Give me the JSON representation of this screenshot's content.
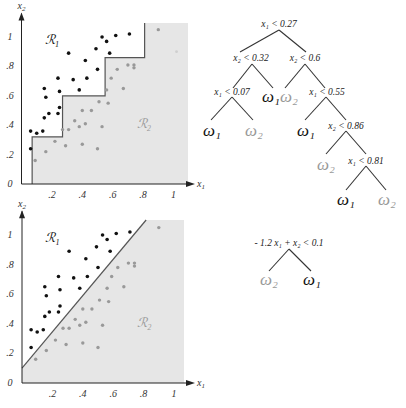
{
  "colors": {
    "class1": "#111111",
    "class2": "#999999",
    "shade": "#e6e6e6",
    "boundary": "#555555",
    "axis": "#222222"
  },
  "chart_data": [
    {
      "type": "scatter",
      "title": "",
      "xlabel": "x1",
      "ylabel": "x2",
      "xlim": [
        0,
        1.1
      ],
      "ylim": [
        0,
        1.1
      ],
      "x_ticks": [
        ".2",
        ".4",
        ".6",
        ".8",
        "1"
      ],
      "y_ticks": [
        "0",
        ".2",
        ".4",
        ".6",
        ".8",
        "1"
      ],
      "regions": [
        {
          "name": "R1",
          "label": "ℛ₁"
        },
        {
          "name": "R2",
          "label": "ℛ₂"
        }
      ],
      "boundary": {
        "kind": "axis-parallel",
        "steps": [
          [
            0.07,
            0
          ],
          [
            0.07,
            0.32
          ],
          [
            0.27,
            0.32
          ],
          [
            0.27,
            0.6
          ],
          [
            0.55,
            0.6
          ],
          [
            0.55,
            0.86
          ],
          [
            0.81,
            0.86
          ],
          [
            0.81,
            1.1
          ]
        ]
      },
      "series": [
        {
          "name": "omega1",
          "points": [
            [
              0.06,
              0.36
            ],
            [
              0.1,
              0.345
            ],
            [
              0.14,
              0.36
            ],
            [
              0.06,
              0.24
            ],
            [
              0.15,
              0.45
            ],
            [
              0.18,
              0.48
            ],
            [
              0.16,
              0.59
            ],
            [
              0.15,
              0.65
            ],
            [
              0.24,
              0.48
            ],
            [
              0.25,
              0.52
            ],
            [
              0.25,
              0.63
            ],
            [
              0.24,
              0.72
            ],
            [
              0.31,
              0.89
            ],
            [
              0.34,
              0.71
            ],
            [
              0.38,
              0.64
            ],
            [
              0.42,
              0.84
            ],
            [
              0.43,
              0.72
            ],
            [
              0.49,
              0.92
            ],
            [
              0.5,
              0.78
            ],
            [
              0.53,
              1.0
            ],
            [
              0.56,
              0.97
            ],
            [
              0.58,
              0.89
            ],
            [
              0.62,
              1.01
            ],
            [
              0.71,
              1.02
            ]
          ]
        },
        {
          "name": "omega2",
          "points": [
            [
              0.09,
              0.16
            ],
            [
              0.16,
              0.22
            ],
            [
              0.22,
              0.29
            ],
            [
              0.27,
              0.37
            ],
            [
              0.29,
              0.26
            ],
            [
              0.31,
              0.37
            ],
            [
              0.35,
              0.43
            ],
            [
              0.38,
              0.39
            ],
            [
              0.4,
              0.27
            ],
            [
              0.4,
              0.5
            ],
            [
              0.42,
              0.41
            ],
            [
              0.46,
              0.5
            ],
            [
              0.5,
              0.24
            ],
            [
              0.51,
              0.56
            ],
            [
              0.53,
              0.39
            ],
            [
              0.56,
              0.64
            ],
            [
              0.57,
              0.55
            ],
            [
              0.59,
              0.72
            ],
            [
              0.63,
              0.78
            ],
            [
              0.67,
              0.65
            ],
            [
              0.7,
              0.81
            ],
            [
              0.74,
              0.81
            ],
            [
              0.74,
              0.79
            ],
            [
              0.9,
              1.05
            ],
            [
              1.02,
              0.9
            ]
          ]
        }
      ]
    },
    {
      "type": "scatter",
      "title": "",
      "xlabel": "x1",
      "ylabel": "x2",
      "xlim": [
        0,
        1.1
      ],
      "ylim": [
        0,
        1.1
      ],
      "x_ticks": [
        ".2",
        ".4",
        ".6",
        ".8",
        "1"
      ],
      "y_ticks": [
        "0",
        ".2",
        ".4",
        ".6",
        ".8",
        "1"
      ],
      "regions": [
        {
          "name": "R1",
          "label": "ℛ₁"
        },
        {
          "name": "R2",
          "label": "ℛ₂"
        }
      ],
      "boundary": {
        "kind": "oblique",
        "equation": "-1.2 x1 + x2 = 0.1"
      },
      "series": [
        {
          "name": "omega1",
          "points": [
            [
              0.06,
              0.36
            ],
            [
              0.1,
              0.345
            ],
            [
              0.14,
              0.36
            ],
            [
              0.06,
              0.24
            ],
            [
              0.15,
              0.45
            ],
            [
              0.18,
              0.48
            ],
            [
              0.16,
              0.59
            ],
            [
              0.15,
              0.65
            ],
            [
              0.24,
              0.48
            ],
            [
              0.25,
              0.52
            ],
            [
              0.25,
              0.63
            ],
            [
              0.24,
              0.72
            ],
            [
              0.31,
              0.89
            ],
            [
              0.34,
              0.71
            ],
            [
              0.38,
              0.64
            ],
            [
              0.42,
              0.84
            ],
            [
              0.43,
              0.72
            ],
            [
              0.49,
              0.92
            ],
            [
              0.5,
              0.78
            ],
            [
              0.53,
              1.0
            ],
            [
              0.56,
              0.97
            ],
            [
              0.58,
              0.89
            ],
            [
              0.62,
              1.01
            ],
            [
              0.71,
              1.02
            ]
          ]
        },
        {
          "name": "omega2",
          "points": [
            [
              0.09,
              0.16
            ],
            [
              0.16,
              0.22
            ],
            [
              0.22,
              0.29
            ],
            [
              0.27,
              0.37
            ],
            [
              0.29,
              0.26
            ],
            [
              0.31,
              0.37
            ],
            [
              0.35,
              0.43
            ],
            [
              0.38,
              0.39
            ],
            [
              0.4,
              0.27
            ],
            [
              0.4,
              0.5
            ],
            [
              0.42,
              0.41
            ],
            [
              0.46,
              0.5
            ],
            [
              0.5,
              0.24
            ],
            [
              0.51,
              0.56
            ],
            [
              0.53,
              0.39
            ],
            [
              0.56,
              0.64
            ],
            [
              0.57,
              0.55
            ],
            [
              0.59,
              0.72
            ],
            [
              0.63,
              0.78
            ],
            [
              0.67,
              0.65
            ],
            [
              0.7,
              0.81
            ],
            [
              0.74,
              0.81
            ],
            [
              0.74,
              0.79
            ],
            [
              0.9,
              1.05
            ]
          ]
        }
      ]
    }
  ],
  "tree_top": {
    "nodes": [
      {
        "id": "n1",
        "label": "x₁ < 0.27"
      },
      {
        "id": "n2",
        "label": "x₂ < 0.32"
      },
      {
        "id": "n3",
        "label": "x₂ < 0.6"
      },
      {
        "id": "n4",
        "label": "x₁ < 0.07"
      },
      {
        "id": "n5",
        "label": "x₁ < 0.55"
      },
      {
        "id": "n6",
        "label": "x₂ < 0.86"
      },
      {
        "id": "n7",
        "label": "x₁ < 0.81"
      }
    ],
    "leaves": [
      {
        "id": "l1",
        "label": "ω₁",
        "class": "omega1"
      },
      {
        "id": "l2",
        "label": "ω₂",
        "class": "omega2"
      },
      {
        "id": "l3",
        "label": "ω₁",
        "class": "omega1"
      },
      {
        "id": "l4",
        "label": "ω₂",
        "class": "omega2"
      },
      {
        "id": "l5",
        "label": "ω₁",
        "class": "omega1"
      },
      {
        "id": "l6",
        "label": "ω₂",
        "class": "omega2"
      },
      {
        "id": "l7",
        "label": "ω₁",
        "class": "omega1"
      },
      {
        "id": "l8",
        "label": "ω₂",
        "class": "omega2"
      }
    ]
  },
  "tree_bottom": {
    "node": "- 1.2 x₁ + x₂ < 0.1",
    "leaves": [
      {
        "label": "ω₂",
        "class": "omega2"
      },
      {
        "label": "ω₁",
        "class": "omega1"
      }
    ]
  },
  "labels": {
    "x1": "x",
    "x1_sub": "1",
    "x2": "x",
    "x2_sub": "2"
  }
}
